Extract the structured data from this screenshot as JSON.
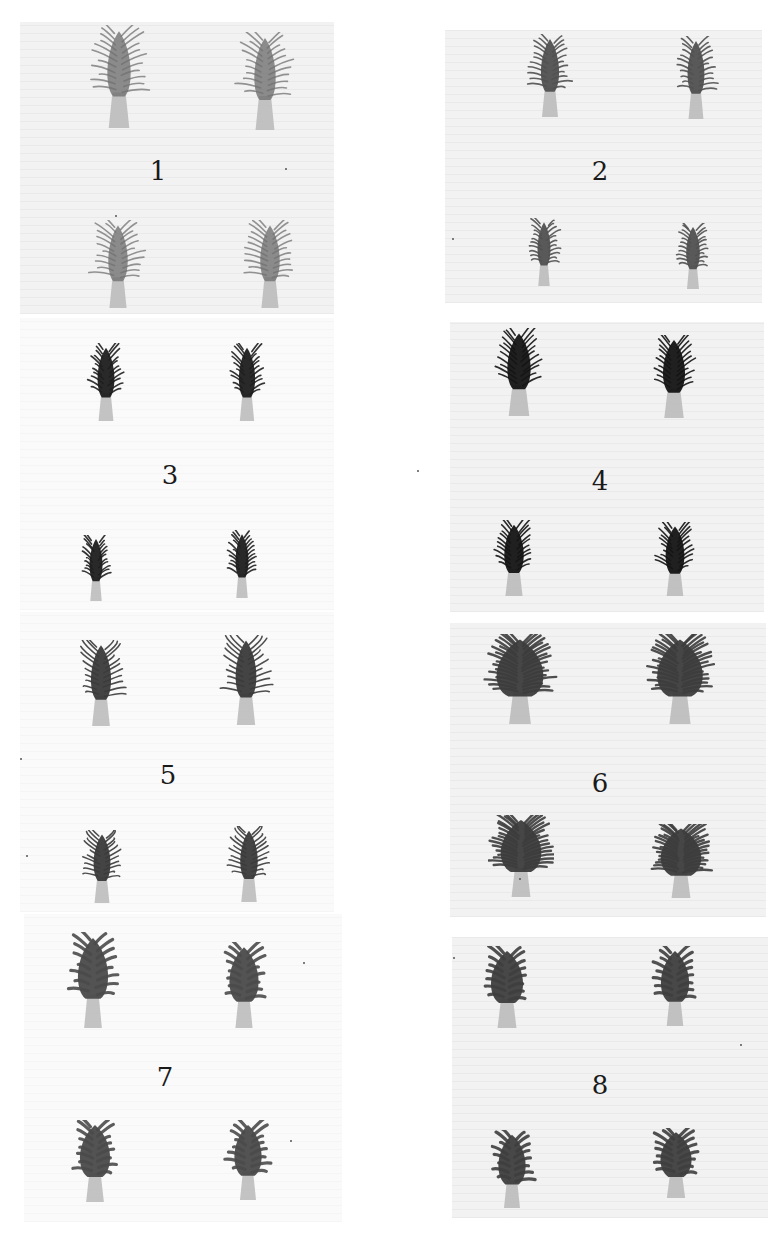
{
  "plate": {
    "panels": [
      {
        "number": "1",
        "column": "left",
        "box": [
          20,
          22,
          314,
          292
        ],
        "bg": "tinted",
        "label_pos": [
          158,
          158
        ],
        "style": "feathery",
        "head_color": "#707070",
        "specimens": [
          {
            "x": 83,
            "y": 25,
            "w": 72,
            "h": 105
          },
          {
            "x": 232,
            "y": 32,
            "w": 66,
            "h": 100
          },
          {
            "x": 88,
            "y": 220,
            "w": 60,
            "h": 90
          },
          {
            "x": 240,
            "y": 220,
            "w": 60,
            "h": 90
          }
        ]
      },
      {
        "number": "2",
        "column": "right",
        "box": [
          445,
          30,
          317,
          273
        ],
        "bg": "tinted",
        "label_pos": [
          600,
          158
        ],
        "style": "spiky",
        "head_color": "#505050",
        "specimens": [
          {
            "x": 522,
            "y": 34,
            "w": 56,
            "h": 85
          },
          {
            "x": 670,
            "y": 36,
            "w": 52,
            "h": 85
          },
          {
            "x": 524,
            "y": 218,
            "w": 40,
            "h": 70
          },
          {
            "x": 672,
            "y": 223,
            "w": 42,
            "h": 68
          }
        ]
      },
      {
        "number": "3",
        "column": "left",
        "box": [
          20,
          318,
          314,
          292
        ],
        "bg": "light",
        "label_pos": [
          170,
          462
        ],
        "style": "comb",
        "head_color": "#1e1e1e",
        "specimens": [
          {
            "x": 80,
            "y": 343,
            "w": 52,
            "h": 80
          },
          {
            "x": 222,
            "y": 343,
            "w": 50,
            "h": 80
          },
          {
            "x": 76,
            "y": 535,
            "w": 40,
            "h": 68
          },
          {
            "x": 222,
            "y": 530,
            "w": 40,
            "h": 70
          }
        ]
      },
      {
        "number": "4",
        "column": "right",
        "box": [
          450,
          322,
          314,
          290
        ],
        "bg": "tinted",
        "label_pos": [
          600,
          468
        ],
        "style": "comb",
        "head_color": "#141414",
        "specimens": [
          {
            "x": 483,
            "y": 328,
            "w": 72,
            "h": 90
          },
          {
            "x": 640,
            "y": 335,
            "w": 68,
            "h": 85
          },
          {
            "x": 484,
            "y": 520,
            "w": 60,
            "h": 78
          },
          {
            "x": 646,
            "y": 522,
            "w": 58,
            "h": 76
          }
        ]
      },
      {
        "number": "5",
        "column": "left",
        "box": [
          20,
          612,
          314,
          300
        ],
        "bg": "light",
        "label_pos": [
          168,
          762
        ],
        "style": "curly",
        "head_color": "#3a3a3a",
        "specimens": [
          {
            "x": 70,
            "y": 640,
            "w": 62,
            "h": 88
          },
          {
            "x": 214,
            "y": 635,
            "w": 64,
            "h": 92
          },
          {
            "x": 76,
            "y": 830,
            "w": 52,
            "h": 75
          },
          {
            "x": 222,
            "y": 826,
            "w": 54,
            "h": 78
          }
        ]
      },
      {
        "number": "6",
        "column": "right",
        "box": [
          450,
          623,
          316,
          294
        ],
        "bg": "tinted",
        "label_pos": [
          600,
          770
        ],
        "style": "bushy",
        "head_color": "#3c3c3c",
        "specimens": [
          {
            "x": 482,
            "y": 634,
            "w": 76,
            "h": 92
          },
          {
            "x": 643,
            "y": 634,
            "w": 74,
            "h": 92
          },
          {
            "x": 488,
            "y": 815,
            "w": 66,
            "h": 84
          },
          {
            "x": 648,
            "y": 824,
            "w": 66,
            "h": 76
          }
        ]
      },
      {
        "number": "7",
        "column": "left",
        "box": [
          24,
          914,
          318,
          308
        ],
        "bg": "light",
        "label_pos": [
          165,
          1064
        ],
        "style": "leafy",
        "head_color": "#4a4a4a",
        "specimens": [
          {
            "x": 62,
            "y": 932,
            "w": 62,
            "h": 98
          },
          {
            "x": 214,
            "y": 942,
            "w": 60,
            "h": 88
          },
          {
            "x": 64,
            "y": 1120,
            "w": 62,
            "h": 84
          },
          {
            "x": 220,
            "y": 1120,
            "w": 56,
            "h": 82
          }
        ]
      },
      {
        "number": "8",
        "column": "right",
        "box": [
          452,
          937,
          316,
          281
        ],
        "bg": "tinted",
        "label_pos": [
          600,
          1072
        ],
        "style": "leafy",
        "head_color": "#3e3e3e",
        "specimens": [
          {
            "x": 474,
            "y": 946,
            "w": 66,
            "h": 84
          },
          {
            "x": 646,
            "y": 946,
            "w": 58,
            "h": 82
          },
          {
            "x": 484,
            "y": 1130,
            "w": 56,
            "h": 80
          },
          {
            "x": 644,
            "y": 1128,
            "w": 64,
            "h": 72
          }
        ]
      }
    ],
    "specks": [
      [
        452,
        238
      ],
      [
        417,
        470
      ],
      [
        285,
        168
      ],
      [
        115,
        215
      ],
      [
        20,
        758
      ],
      [
        519,
        878
      ],
      [
        303,
        962
      ],
      [
        453,
        957
      ],
      [
        740,
        1044
      ],
      [
        26,
        855
      ],
      [
        290,
        1140
      ]
    ]
  }
}
